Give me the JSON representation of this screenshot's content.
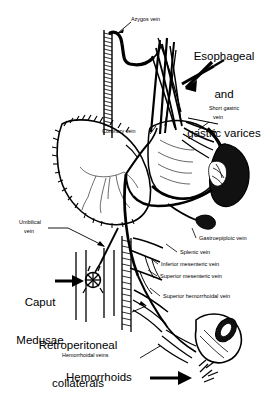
{
  "figure": {
    "background_color": "#ffffff",
    "ink_color": "#000000"
  },
  "callouts": {
    "esophageal_gastric_varices": "Esophageal\nand\ngastric varices",
    "esophageal_line1": "Esophageal",
    "esophageal_line2": "and",
    "esophageal_line3": "gastric varices",
    "caput_medusae_line1": "Caput",
    "caput_medusae_line2": "Medusae",
    "retroperitoneal_line1": "Retroperitoneal",
    "retroperitoneal_line2": "collaterals",
    "hemorrhoids": "Hemorrhoids"
  },
  "labels": [
    {
      "id": "azygos-vein",
      "text": "Azygos vein"
    },
    {
      "id": "short-gastric-vein",
      "text": "Short gastric\nvein"
    },
    {
      "id": "short-gastric-vein-line1",
      "text": "Short gastric"
    },
    {
      "id": "short-gastric-vein-line2",
      "text": "vein"
    },
    {
      "id": "coronary-vein",
      "text": "Coronary vein"
    },
    {
      "id": "umbilical-vein-line1",
      "text": "Umbilical"
    },
    {
      "id": "umbilical-vein-line2",
      "text": "vein"
    },
    {
      "id": "gastroepiploic-vein",
      "text": "Gastroepiploic vein"
    },
    {
      "id": "splenic-vein",
      "text": "Splenic vein"
    },
    {
      "id": "inferior-mesenteric-vein",
      "text": "Inferior mesenteric vein"
    },
    {
      "id": "superior-mesenteric-vein",
      "text": "Superior mesenteric vein"
    },
    {
      "id": "superior-hemorrhoidal-vein",
      "text": "Superior hemorrhoidal vein"
    },
    {
      "id": "hemorrhoidal-veins",
      "text": "Hemorrhoidal veins"
    }
  ],
  "anatomy": {
    "organs": [
      "esophagus",
      "liver",
      "stomach",
      "spleen",
      "rectum",
      "abdominal-wall"
    ],
    "vessels": [
      "azygos-vein",
      "coronary-vein",
      "short-gastric-vein",
      "splenic-vein",
      "portal-vein",
      "umbilical-vein",
      "gastroepiploic-vein",
      "inferior-mesenteric-vein",
      "superior-mesenteric-vein",
      "superior-hemorrhoidal-vein",
      "hemorrhoidal-veins"
    ]
  }
}
